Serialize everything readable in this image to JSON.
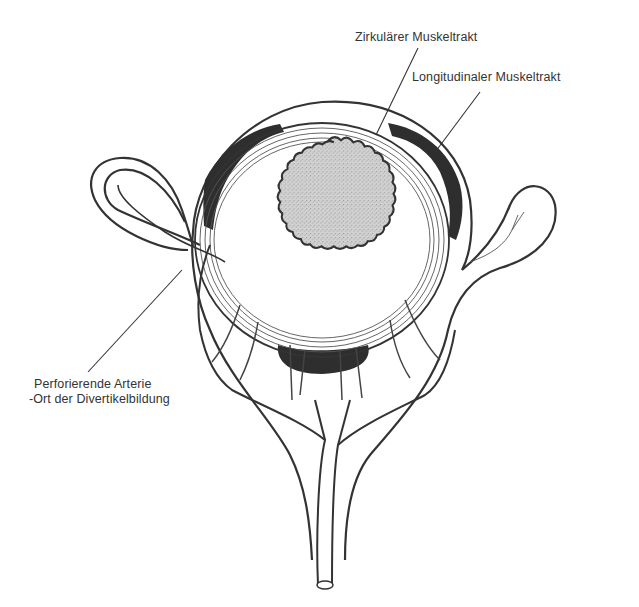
{
  "figure": {
    "colors": {
      "ink": "#333333",
      "lumen_fill": "#bdbdbd",
      "muscle_band": "#2e2e2e",
      "background": "#ffffff"
    }
  },
  "labels": [
    {
      "id": "circular",
      "text": "Zirkulärer Muskeltrakt"
    },
    {
      "id": "longitudinal",
      "text": "Longitudinaler Muskeltrakt"
    },
    {
      "id": "artery_line1",
      "text": "Perforierende Arterie"
    },
    {
      "id": "artery_line2",
      "text": "-Ort der Divertikelbildung"
    }
  ]
}
